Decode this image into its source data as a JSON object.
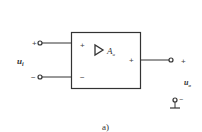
{
  "diagram": {
    "type": "amplifier-block",
    "caption": "a)",
    "block": {
      "symbol": "▷",
      "gain_label": "A",
      "gain_subscript": "u",
      "input_plus": "+",
      "input_minus": "−",
      "output_plus": "+"
    },
    "input": {
      "label": "u",
      "label_subscript": "i",
      "plus_sign": "+",
      "minus_sign": "−"
    },
    "output": {
      "label": "u",
      "label_subscript": "o",
      "plus_sign": "+",
      "minus_sign": "−"
    },
    "colors": {
      "stroke": "#333333",
      "background": "#ffffff"
    }
  }
}
